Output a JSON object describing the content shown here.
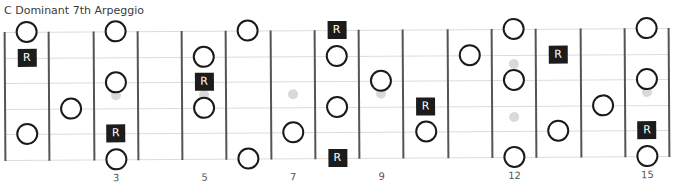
{
  "title": "C Dominant 7th Arpeggio",
  "root_label": "R",
  "strings": 6,
  "frets_shown": 15,
  "fret_numbers": [
    3,
    5,
    7,
    9,
    12,
    15
  ],
  "inlays": [
    {
      "fret": 3,
      "type": "single"
    },
    {
      "fret": 5,
      "type": "single"
    },
    {
      "fret": 7,
      "type": "single"
    },
    {
      "fret": 9,
      "type": "single"
    },
    {
      "fret": 12,
      "type": "double"
    },
    {
      "fret": 15,
      "type": "single"
    }
  ],
  "notes": [
    {
      "fret": 1,
      "string": 1,
      "root": false
    },
    {
      "fret": 1,
      "string": 2,
      "root": true
    },
    {
      "fret": 1,
      "string": 5,
      "root": false
    },
    {
      "fret": 2,
      "string": 4,
      "root": false
    },
    {
      "fret": 3,
      "string": 1,
      "root": false
    },
    {
      "fret": 3,
      "string": 3,
      "root": false
    },
    {
      "fret": 3,
      "string": 5,
      "root": true
    },
    {
      "fret": 3,
      "string": 6,
      "root": false
    },
    {
      "fret": 5,
      "string": 2,
      "root": false
    },
    {
      "fret": 5,
      "string": 3,
      "root": true
    },
    {
      "fret": 5,
      "string": 4,
      "root": false
    },
    {
      "fret": 6,
      "string": 1,
      "root": false
    },
    {
      "fret": 6,
      "string": 6,
      "root": false
    },
    {
      "fret": 7,
      "string": 5,
      "root": false
    },
    {
      "fret": 8,
      "string": 1,
      "root": true
    },
    {
      "fret": 8,
      "string": 2,
      "root": false
    },
    {
      "fret": 8,
      "string": 4,
      "root": false
    },
    {
      "fret": 8,
      "string": 6,
      "root": true
    },
    {
      "fret": 9,
      "string": 3,
      "root": false
    },
    {
      "fret": 10,
      "string": 4,
      "root": true
    },
    {
      "fret": 10,
      "string": 5,
      "root": false
    },
    {
      "fret": 11,
      "string": 2,
      "root": false
    },
    {
      "fret": 12,
      "string": 1,
      "root": false
    },
    {
      "fret": 12,
      "string": 3,
      "root": false
    },
    {
      "fret": 12,
      "string": 6,
      "root": false
    },
    {
      "fret": 13,
      "string": 2,
      "root": true
    },
    {
      "fret": 13,
      "string": 5,
      "root": false
    },
    {
      "fret": 14,
      "string": 4,
      "root": false
    },
    {
      "fret": 15,
      "string": 1,
      "root": false
    },
    {
      "fret": 15,
      "string": 3,
      "root": false
    },
    {
      "fret": 15,
      "string": 5,
      "root": true
    },
    {
      "fret": 15,
      "string": 6,
      "root": false
    }
  ],
  "colors": {
    "fret_line": "#555555",
    "string_line": "#dcdcdc",
    "root_fill": "#1c1c1c",
    "note_stroke": "#1a1a1a",
    "inlay": "#d9d9d9"
  }
}
